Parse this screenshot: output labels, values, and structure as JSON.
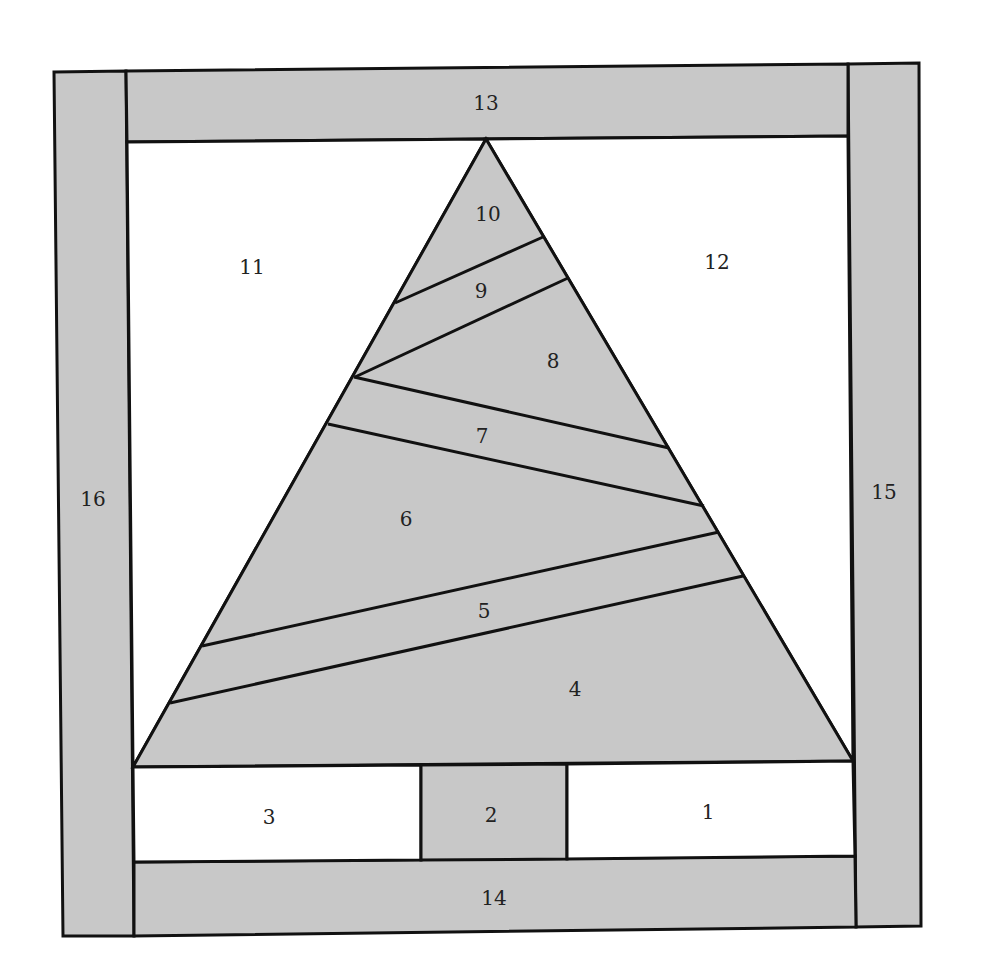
{
  "diagram": {
    "type": "paper-pieced quilt block pattern (Christmas tree)",
    "colors": {
      "background": "#ffffff",
      "shaded_fill": "#c8c8c8",
      "unshaded_fill": "#ffffff",
      "outline": "#111111",
      "label": "#222222"
    },
    "pieces": [
      {
        "id": "1",
        "label": "1",
        "shaded": false,
        "region": "bottom-right background"
      },
      {
        "id": "2",
        "label": "2",
        "shaded": true,
        "region": "tree trunk"
      },
      {
        "id": "3",
        "label": "3",
        "shaded": false,
        "region": "bottom-left background"
      },
      {
        "id": "4",
        "label": "4",
        "shaded": true,
        "region": "tree section"
      },
      {
        "id": "5",
        "label": "5",
        "shaded": true,
        "region": "tree strip"
      },
      {
        "id": "6",
        "label": "6",
        "shaded": true,
        "region": "tree section"
      },
      {
        "id": "7",
        "label": "7",
        "shaded": true,
        "region": "tree strip"
      },
      {
        "id": "8",
        "label": "8",
        "shaded": true,
        "region": "tree section"
      },
      {
        "id": "9",
        "label": "9",
        "shaded": true,
        "region": "tree strip"
      },
      {
        "id": "10",
        "label": "10",
        "shaded": true,
        "region": "tree top"
      },
      {
        "id": "11",
        "label": "11",
        "shaded": false,
        "region": "left sky background"
      },
      {
        "id": "12",
        "label": "12",
        "shaded": false,
        "region": "right sky background"
      },
      {
        "id": "13",
        "label": "13",
        "shaded": true,
        "region": "top border"
      },
      {
        "id": "14",
        "label": "14",
        "shaded": true,
        "region": "bottom border"
      },
      {
        "id": "15",
        "label": "15",
        "shaded": true,
        "region": "right border"
      },
      {
        "id": "16",
        "label": "16",
        "shaded": true,
        "region": "left border"
      }
    ]
  }
}
